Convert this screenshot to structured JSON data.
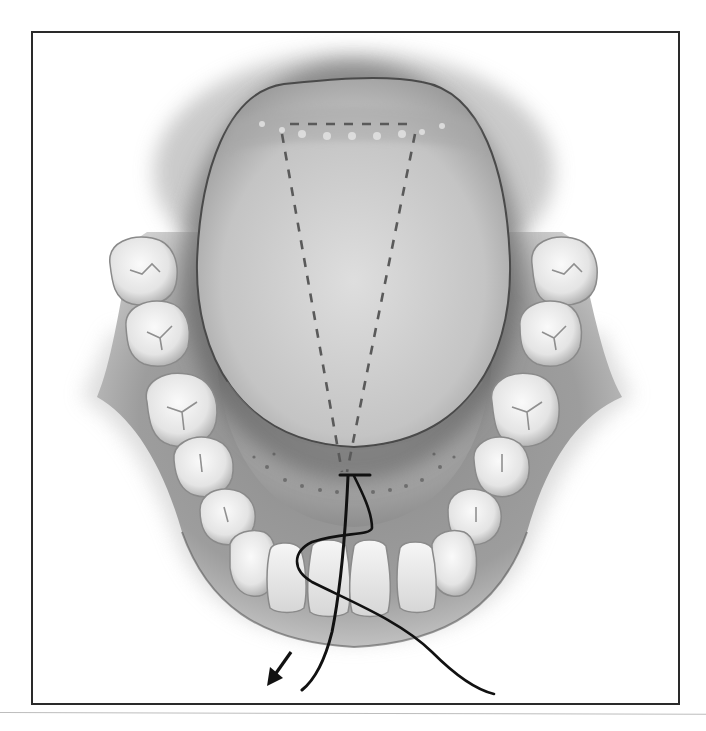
{
  "figure": {
    "type": "medical-illustration",
    "palette": {
      "background": "#ffffff",
      "frame": "#2a2a2a",
      "tongue": "#c9c9c9",
      "tongue_edge": "#555555",
      "gum": "#9e9e9e",
      "tooth": "#ededed",
      "tooth_edge": "#8a8a8a",
      "dashed_line": "#5a5a5a",
      "suture": "#111111"
    },
    "elements": {
      "tongue": "tongue",
      "wedge_outline": "dashed wedge excision outline",
      "floor_of_mouth": "floor of mouth",
      "suture_thread": "suture",
      "direction_arrow": "pull direction arrow",
      "teeth_left_count": 7,
      "teeth_right_count": 7,
      "incisors_count": 4
    }
  }
}
